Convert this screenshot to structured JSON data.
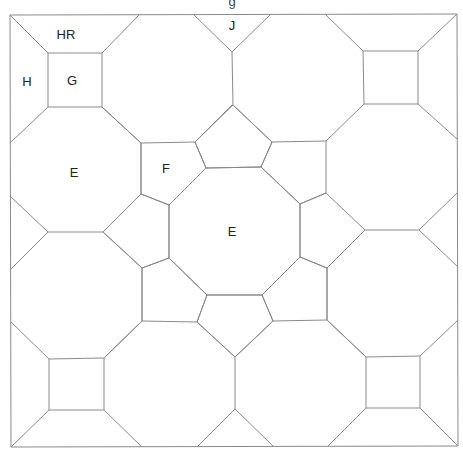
{
  "diagram": {
    "title_cutoff": "g",
    "stroke_color": "#8a8a8a",
    "text_color": "#222222",
    "frame": {
      "left": 10,
      "top": 15,
      "right": 457,
      "bottom": 447
    },
    "labels": [
      {
        "id": "hr",
        "text": "HR",
        "x": 66,
        "y": 34
      },
      {
        "id": "h",
        "text": "H",
        "x": 27,
        "y": 81
      },
      {
        "id": "g",
        "text": "G",
        "x": 72,
        "y": 80
      },
      {
        "id": "j",
        "text": "J",
        "x": 232,
        "y": 25
      },
      {
        "id": "e1",
        "text": "E",
        "x": 74,
        "y": 172
      },
      {
        "id": "f",
        "text": "F",
        "x": 166,
        "y": 168
      },
      {
        "id": "e2",
        "text": "E",
        "x": 232,
        "y": 231
      }
    ],
    "shapes": [
      {
        "name": "frame",
        "points": "10,15 457,14 458,446 11,447"
      },
      {
        "name": "square-top-left",
        "points": "48,53 102,53 102,107 48,107"
      },
      {
        "name": "square-top-right",
        "points": "363,51 418,51 418,104 364,104"
      },
      {
        "name": "square-bottom-left",
        "points": "49,359 104,358 104,410 49,410"
      },
      {
        "name": "square-bottom-right",
        "points": "366,357 420,356 420,408 366,408"
      },
      {
        "name": "octagon-center",
        "points": "206,168 261,167 300,204 300,257 262,295 207,295 169,258 169,205"
      },
      {
        "name": "pentagon-top",
        "points": "195,142 233,105 272,142 261,167 206,168"
      },
      {
        "name": "pentagon-left",
        "points": "141,194 103,232 142,268 169,258 169,205"
      },
      {
        "name": "pentagon-right",
        "points": "300,204 326,193 365,230 327,268 300,257"
      },
      {
        "name": "pentagon-bottom",
        "points": "207,295 262,295 273,321 235,357 197,322"
      },
      {
        "name": "quad-f-top-left",
        "points": "141,143 195,142 206,168 169,205 141,194"
      },
      {
        "name": "quad-f-top-right",
        "points": "272,142 326,141 326,193 300,204 261,167"
      },
      {
        "name": "quad-f-bottom-left",
        "points": "142,268 169,258 207,295 197,322 142,321"
      },
      {
        "name": "quad-f-bottom-right",
        "points": "300,257 327,268 327,320 273,321 262,295"
      }
    ],
    "lines": [
      {
        "name": "tl-sq-diag-a",
        "x1": 10,
        "y1": 15,
        "x2": 48,
        "y2": 53
      },
      {
        "name": "tl-sq-diag-b",
        "x1": 139,
        "y1": 15,
        "x2": 102,
        "y2": 53
      },
      {
        "name": "tl-sq-diag-c",
        "x1": 10,
        "y1": 143,
        "x2": 48,
        "y2": 107
      },
      {
        "name": "tl-sq-diag-d",
        "x1": 102,
        "y1": 107,
        "x2": 141,
        "y2": 143
      },
      {
        "name": "tl-oct-left-edge",
        "x1": 141,
        "y1": 143,
        "x2": 141,
        "y2": 194
      },
      {
        "name": "j-left",
        "x1": 194,
        "y1": 15,
        "x2": 232,
        "y2": 52
      },
      {
        "name": "j-right",
        "x1": 270,
        "y1": 15,
        "x2": 232,
        "y2": 52
      },
      {
        "name": "j-stem",
        "x1": 232,
        "y1": 52,
        "x2": 233,
        "y2": 105
      },
      {
        "name": "oct-tl-edge",
        "x1": 141,
        "y1": 143,
        "x2": 141,
        "y2": 143
      },
      {
        "name": "tr-sq-diag-a",
        "x1": 325,
        "y1": 14,
        "x2": 363,
        "y2": 51
      },
      {
        "name": "tr-sq-diag-b",
        "x1": 457,
        "y1": 14,
        "x2": 418,
        "y2": 51
      },
      {
        "name": "tr-sq-diag-c",
        "x1": 364,
        "y1": 104,
        "x2": 326,
        "y2": 141
      },
      {
        "name": "tr-sq-diag-d",
        "x1": 418,
        "y1": 104,
        "x2": 457,
        "y2": 139
      },
      {
        "name": "left-tri-a",
        "x1": 10,
        "y1": 196,
        "x2": 48,
        "y2": 232
      },
      {
        "name": "left-tri-b",
        "x1": 48,
        "y1": 232,
        "x2": 10,
        "y2": 270
      },
      {
        "name": "left-bar",
        "x1": 48,
        "y1": 232,
        "x2": 103,
        "y2": 232
      },
      {
        "name": "right-tri-a",
        "x1": 457,
        "y1": 193,
        "x2": 419,
        "y2": 230
      },
      {
        "name": "right-tri-b",
        "x1": 419,
        "y1": 230,
        "x2": 457,
        "y2": 266
      },
      {
        "name": "right-bar",
        "x1": 365,
        "y1": 230,
        "x2": 419,
        "y2": 230
      },
      {
        "name": "bl-sq-diag-a",
        "x1": 11,
        "y1": 322,
        "x2": 49,
        "y2": 359
      },
      {
        "name": "bl-sq-diag-b",
        "x1": 104,
        "y1": 358,
        "x2": 142,
        "y2": 321
      },
      {
        "name": "bl-sq-diag-c",
        "x1": 49,
        "y1": 410,
        "x2": 11,
        "y2": 447
      },
      {
        "name": "bl-sq-diag-d",
        "x1": 104,
        "y1": 410,
        "x2": 142,
        "y2": 447
      },
      {
        "name": "b-tri-left",
        "x1": 197,
        "y1": 447,
        "x2": 235,
        "y2": 409
      },
      {
        "name": "b-tri-right",
        "x1": 235,
        "y1": 409,
        "x2": 273,
        "y2": 446
      },
      {
        "name": "b-stem",
        "x1": 235,
        "y1": 357,
        "x2": 235,
        "y2": 409
      },
      {
        "name": "br-sq-diag-a",
        "x1": 327,
        "y1": 320,
        "x2": 366,
        "y2": 357
      },
      {
        "name": "br-sq-diag-b",
        "x1": 420,
        "y1": 356,
        "x2": 458,
        "y2": 320
      },
      {
        "name": "br-sq-diag-c",
        "x1": 366,
        "y1": 408,
        "x2": 328,
        "y2": 446
      },
      {
        "name": "br-sq-diag-d",
        "x1": 420,
        "y1": 408,
        "x2": 458,
        "y2": 446
      },
      {
        "name": "oct-upleft-diag",
        "x1": 141,
        "y1": 143,
        "x2": 102,
        "y2": 107
      },
      {
        "name": "oct-upleft-diag2",
        "x1": 195,
        "y1": 142,
        "x2": 232,
        "y2": 105
      },
      {
        "name": "oct-upright-diag",
        "x1": 272,
        "y1": 142,
        "x2": 233,
        "y2": 105
      },
      {
        "name": "oct-left-upper-diag",
        "x1": 103,
        "y1": 232,
        "x2": 141,
        "y2": 194
      },
      {
        "name": "oct-left-lower-diag",
        "x1": 103,
        "y1": 232,
        "x2": 142,
        "y2": 268
      },
      {
        "name": "oct-left-vert-low",
        "x1": 142,
        "y1": 268,
        "x2": 142,
        "y2": 321
      },
      {
        "name": "oct-right-vert-low",
        "x1": 327,
        "y1": 268,
        "x2": 327,
        "y2": 320
      },
      {
        "name": "oct-bottom-diag-l",
        "x1": 142,
        "y1": 321,
        "x2": 104,
        "y2": 358
      },
      {
        "name": "oct-bottom-diag-l2",
        "x1": 197,
        "y1": 322,
        "x2": 235,
        "y2": 357
      },
      {
        "name": "oct-bottom-diag-r",
        "x1": 273,
        "y1": 321,
        "x2": 235,
        "y2": 357
      },
      {
        "name": "oct-bottom-diag-r2",
        "x1": 327,
        "y1": 320,
        "x2": 366,
        "y2": 357
      }
    ]
  }
}
